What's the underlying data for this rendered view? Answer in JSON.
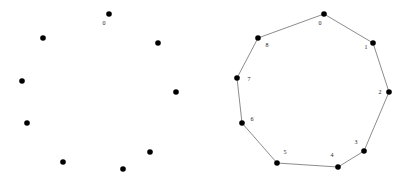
{
  "figure": {
    "width": 410,
    "height": 178,
    "background": "#ffffff",
    "style": {
      "dot_color": "#000000",
      "dot_radius": 2.8,
      "edge_color": "#5a5a5a",
      "edge_width": 0.7,
      "label_color": "#222222",
      "label_font_size": 6
    },
    "panels": [
      {
        "name": "point-set",
        "points": [
          {
            "x": 109,
            "y": 14,
            "label": "0",
            "lx": 104,
            "ly": 24
          },
          {
            "x": 158,
            "y": 43
          },
          {
            "x": 176,
            "y": 92
          },
          {
            "x": 150,
            "y": 152
          },
          {
            "x": 123,
            "y": 169
          },
          {
            "x": 63,
            "y": 162
          },
          {
            "x": 27,
            "y": 123
          },
          {
            "x": 22,
            "y": 81
          },
          {
            "x": 43,
            "y": 38
          }
        ],
        "edges": []
      },
      {
        "name": "polygon",
        "points": [
          {
            "x": 324,
            "y": 14,
            "label": "0",
            "lx": 320,
            "ly": 24
          },
          {
            "x": 373,
            "y": 43,
            "label": "1",
            "lx": 366,
            "ly": 48
          },
          {
            "x": 389,
            "y": 92,
            "label": "2",
            "lx": 380,
            "ly": 93
          },
          {
            "x": 364,
            "y": 151,
            "label": "3",
            "lx": 356,
            "ly": 143
          },
          {
            "x": 338,
            "y": 167,
            "label": "4",
            "lx": 332,
            "ly": 156
          },
          {
            "x": 277,
            "y": 163,
            "label": "5",
            "lx": 285,
            "ly": 153
          },
          {
            "x": 242,
            "y": 123,
            "label": "6",
            "lx": 252,
            "ly": 120
          },
          {
            "x": 237,
            "y": 78,
            "label": "7",
            "lx": 249,
            "ly": 80
          },
          {
            "x": 258,
            "y": 38,
            "label": "8",
            "lx": 267,
            "ly": 46
          }
        ],
        "edges": [
          [
            0,
            1
          ],
          [
            1,
            2
          ],
          [
            2,
            3
          ],
          [
            3,
            4
          ],
          [
            4,
            5
          ],
          [
            5,
            6
          ],
          [
            6,
            7
          ],
          [
            7,
            8
          ],
          [
            8,
            0
          ]
        ]
      }
    ]
  }
}
